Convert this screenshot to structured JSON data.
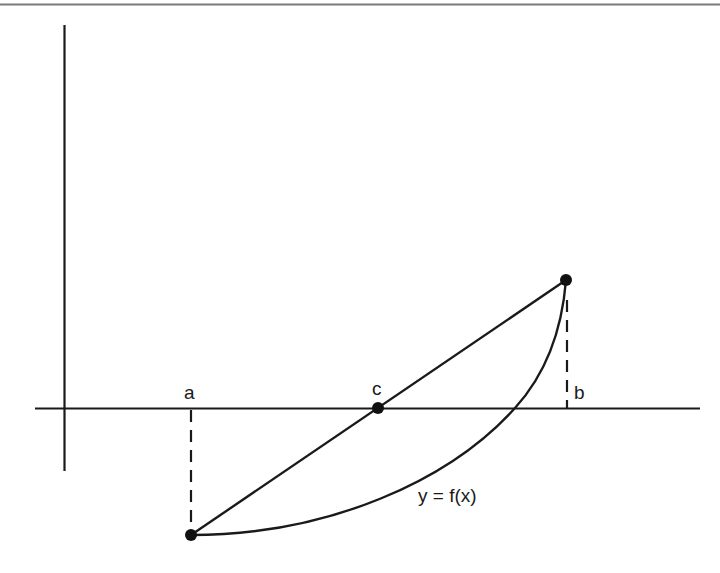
{
  "diagram": {
    "type": "secant-line-root-approximation",
    "labels": {
      "a": "a",
      "b": "b",
      "c": "c",
      "curve": "y = f(x)"
    },
    "colors": {
      "stroke": "#1a1a1a",
      "top_rule": "#7a7a7a",
      "background": "#ffffff"
    },
    "axes": {
      "x_axis": {
        "x1": 35,
        "x2": 700,
        "y": 408
      },
      "y_axis": {
        "x": 64,
        "y1": 25,
        "y2": 471
      }
    },
    "points": [
      {
        "name": "point-a",
        "x": 191,
        "y": 535
      },
      {
        "name": "point-c",
        "x": 378,
        "y": 408
      },
      {
        "name": "point-b",
        "x": 566,
        "y": 280
      }
    ],
    "dashed_lines": [
      {
        "name": "dashed-a",
        "x": 191,
        "y1": 410,
        "y2": 535
      },
      {
        "name": "dashed-b",
        "x": 567,
        "y1": 282,
        "y2": 408
      }
    ]
  }
}
